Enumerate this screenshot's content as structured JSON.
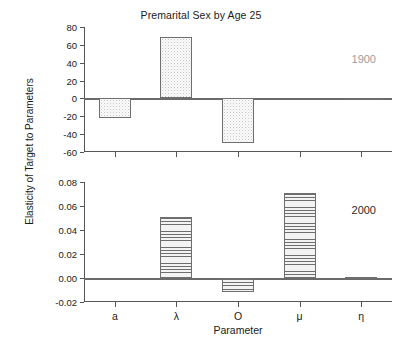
{
  "chart_data": {
    "type": "bar",
    "title": "Premarital Sex by Age 25",
    "xlabel": "Parameter",
    "ylabel": "Elasticity of Target to Parameters",
    "categories": [
      "a",
      "λ",
      "O",
      "μ",
      "η"
    ],
    "grid": false,
    "legend_position": "none",
    "panels": [
      {
        "annotation": "1900",
        "values": [
          -22,
          69,
          -50,
          0,
          -2
        ],
        "ylim": [
          -60,
          80
        ],
        "yticks": [
          80,
          60,
          40,
          20,
          0,
          -20,
          -40,
          -60
        ],
        "ytick_labels": [
          "80",
          "60",
          "40",
          "20",
          "0",
          "-20",
          "-40",
          "-60"
        ],
        "fill": "dots"
      },
      {
        "annotation": "2000",
        "values": [
          0,
          0.051,
          -0.012,
          0.071,
          0.001
        ],
        "ylim": [
          -0.02,
          0.08
        ],
        "yticks": [
          0.08,
          0.06,
          0.04,
          0.02,
          0.0,
          -0.02
        ],
        "ytick_labels": [
          "0.08",
          "0.06",
          "0.04",
          "0.02",
          "0.00",
          "-0.02"
        ],
        "fill": "hlines"
      }
    ]
  },
  "figure": {
    "title": "Premarital Sex by Age 25",
    "ylabel": "Elasticity of Target to Parameters",
    "xlabel": "Parameter"
  }
}
